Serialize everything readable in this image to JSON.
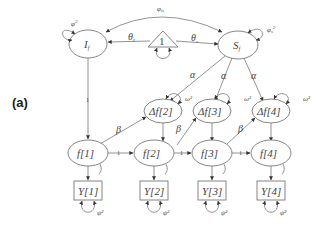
{
  "panel": {
    "label": "(a)"
  },
  "nodes": {
    "intercept": {
      "label": "I",
      "sub": "f",
      "variance": "φ",
      "variance_sup": "2",
      "type": "latent"
    },
    "slope": {
      "label": "S",
      "sub": "f",
      "variance": "φ",
      "variance_sub": "s",
      "variance_sup": "2",
      "type": "latent"
    },
    "constant": {
      "label": "1",
      "type": "constant-triangle"
    },
    "true_scores": [
      {
        "label": "f[1]"
      },
      {
        "label": "f[2]"
      },
      {
        "label": "f[3]"
      },
      {
        "label": "f[4]"
      }
    ],
    "changes": [
      {
        "label": "Δf[2]",
        "variance": "ω²"
      },
      {
        "label": "Δf[3]",
        "variance": "ω²"
      },
      {
        "label": "Δf[4]",
        "variance": "ω²"
      }
    ],
    "observed": [
      {
        "label": "Y[1]",
        "variance": "ψ²"
      },
      {
        "label": "Y[2]",
        "variance": "ψ²"
      },
      {
        "label": "Y[3]",
        "variance": "ψ²"
      },
      {
        "label": "Y[4]",
        "variance": "ψ²"
      }
    ]
  },
  "edges": {
    "covariance_is": "φ",
    "covariance_is_sub": "is",
    "mean_intercept": "θ",
    "mean_intercept_sub": "I",
    "mean_slope": "θ",
    "mean_slope_sub": "s",
    "slope_to_change": "α",
    "autoproportion": "β",
    "unit_path": "1"
  }
}
